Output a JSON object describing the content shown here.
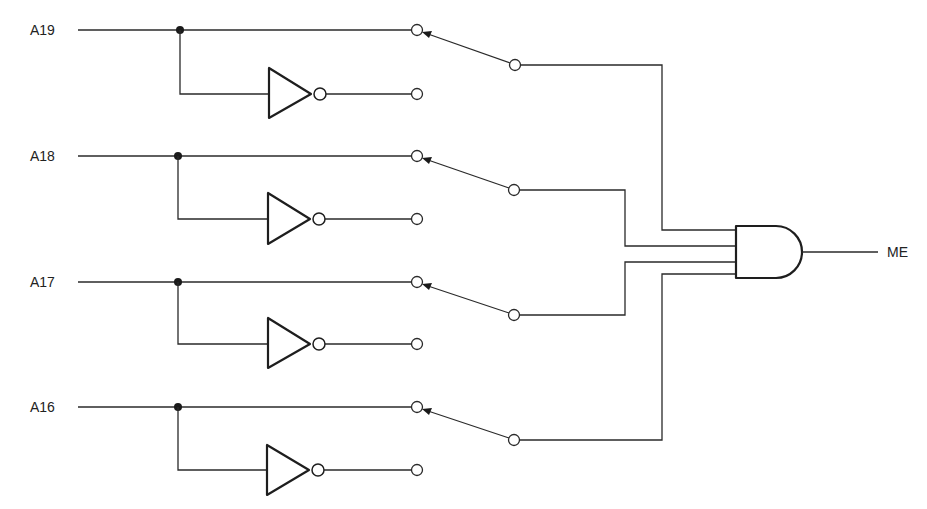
{
  "diagram": {
    "type": "logic-circuit",
    "inputs": [
      {
        "label": "A19",
        "switch_position": "true"
      },
      {
        "label": "A18",
        "switch_position": "true"
      },
      {
        "label": "A17",
        "switch_position": "true"
      },
      {
        "label": "A16",
        "switch_position": "true"
      }
    ],
    "gate": {
      "type": "AND",
      "input_count": 4
    },
    "output": {
      "label": "ME"
    },
    "colors": {
      "line": "#2a2a2a",
      "background": "#ffffff"
    }
  }
}
